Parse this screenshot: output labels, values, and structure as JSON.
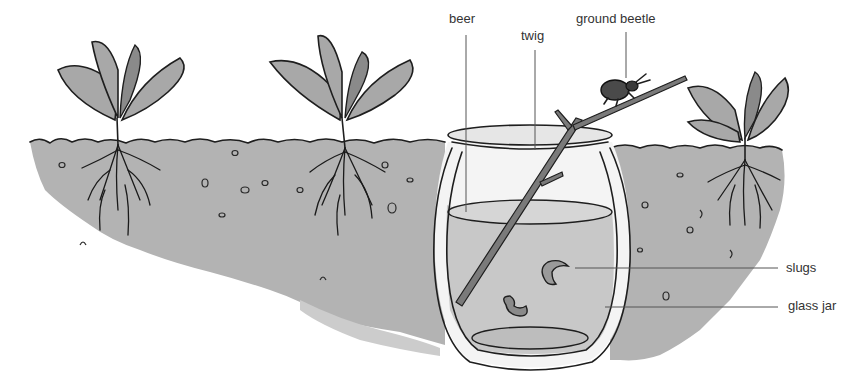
{
  "figure": {
    "labels": {
      "beer": "beer",
      "twig": "twig",
      "ground_beetle": "ground beetle",
      "slugs": "slugs",
      "glass_jar": "glass jar"
    },
    "colors": {
      "background": "#ffffff",
      "soil": "#b3b3b3",
      "beer": "#c8c8c8",
      "ink": "#1e1e1e",
      "label_text": "#333333",
      "leader_line": "#555555"
    },
    "elements": [
      "plant-left",
      "plant-middle",
      "plant-right",
      "soil",
      "glass-jar",
      "beer",
      "twig",
      "ground-beetle",
      "slugs"
    ]
  }
}
